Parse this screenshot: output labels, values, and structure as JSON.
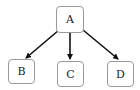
{
  "diagram": {
    "type": "tree",
    "nodes": [
      {
        "id": "A",
        "label": "A"
      },
      {
        "id": "B",
        "label": "B"
      },
      {
        "id": "C",
        "label": "C"
      },
      {
        "id": "D",
        "label": "D"
      }
    ],
    "edges": [
      {
        "from": "A",
        "to": "B"
      },
      {
        "from": "A",
        "to": "C"
      },
      {
        "from": "A",
        "to": "D"
      }
    ]
  }
}
